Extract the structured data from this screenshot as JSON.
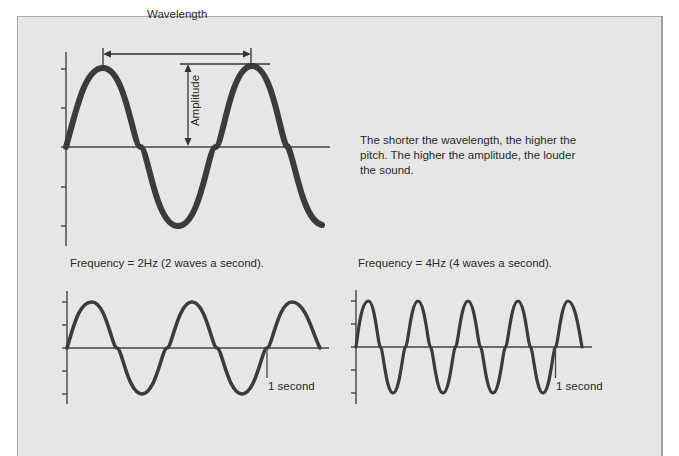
{
  "diagram": {
    "colors": {
      "background": "#e6e6e6",
      "wave": "#3b3b3b",
      "axis": "#444444",
      "text": "#2a2a2a",
      "frame": "#a9a9a9"
    },
    "main_wave": {
      "wavelength_label": "Wavelength",
      "amplitude_label": "Amplitude",
      "caption": "The shorter the wavelength, the higher the pitch. The higher the amplitude, the louder the sound."
    },
    "wave_2hz": {
      "label": "Frequency = 2Hz (2 waves a second).",
      "marker_label": "1 second",
      "cycles_per_second": 2
    },
    "wave_4hz": {
      "label": "Frequency = 4Hz (4 waves a second).",
      "marker_label": "1 second",
      "cycles_per_second": 4
    }
  }
}
